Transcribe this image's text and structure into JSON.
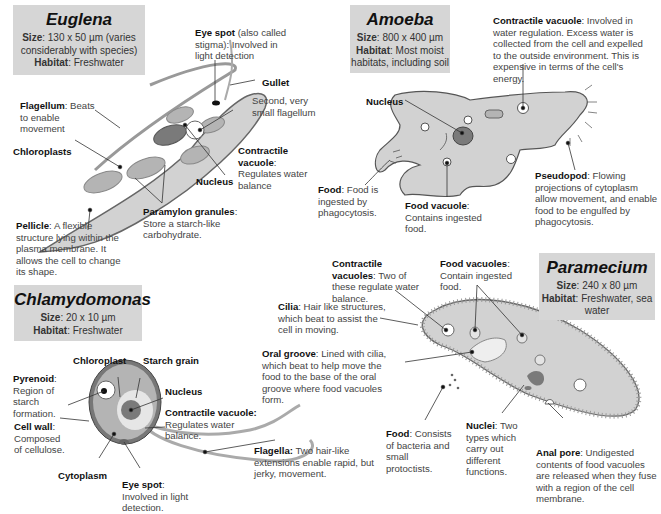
{
  "euglena": {
    "title": "Euglena",
    "size_label": "Size",
    "size_value": ": 130 x 50 µm (varies considerably with species)",
    "habitat_label": "Habitat",
    "habitat_value": ": Freshwater",
    "labels": {
      "eye_spot": {
        "bold": "Eye spot",
        "text": " (also called stigma): Involved in light detection"
      },
      "gullet": {
        "bold": "Gullet",
        "text": ""
      },
      "second_flagellum": {
        "bold": "",
        "text": "Second, very small flagellum"
      },
      "flagellum": {
        "bold": "Flagellum",
        "text": ": Beats to enable  movement"
      },
      "chloroplasts": {
        "bold": "Chloroplasts",
        "text": ""
      },
      "contractile_vacuole": {
        "bold": "Contractile vacuole",
        "text": ": Regulates water balance"
      },
      "nucleus": {
        "bold": "Nucleus",
        "text": ""
      },
      "paramylon": {
        "bold": "Paramylon granules",
        "text": ": Store a starch-like carbohydrate."
      },
      "pellicle": {
        "bold": "Pellicle",
        "text": ": A flexible structure lying within the plasma membrane. It allows the cell to change its shape."
      }
    }
  },
  "amoeba": {
    "title": "Amoeba",
    "size_label": "Size",
    "size_value": ": 800 x 400 µm",
    "habitat_label": "Habitat",
    "habitat_value": ": Most moist habitats, including soil",
    "labels": {
      "contractile_vacuole": {
        "bold": "Contractile vacuole",
        "text": ": Involved in water regulation. Excess water is collected from the cell and expelled to the outside environment. This is expensive in terms of the cell's energy."
      },
      "nucleus": {
        "bold": "Nucleus",
        "text": ""
      },
      "pseudopod": {
        "bold": "Pseudopod",
        "text": ": Flowing projections of cytoplasm allow movement, and enable food to be engulfed by phagocytosis."
      },
      "food": {
        "bold": "Food",
        "text": ": Food is ingested by phagocytosis."
      },
      "food_vacuole": {
        "bold": "Food vacuole",
        "text": ": Contains ingested food."
      }
    }
  },
  "chlamydomonas": {
    "title": "Chlamydomonas",
    "size_label": "Size",
    "size_value": ": 20 x 10 µm",
    "habitat_label": "Habitat",
    "habitat_value": ": Freshwater",
    "labels": {
      "chloroplast": {
        "bold": "Chloroplast",
        "text": ""
      },
      "starch_grain": {
        "bold": "Starch grain",
        "text": ""
      },
      "pyrenoid": {
        "bold": "Pyrenoid",
        "text": ": Region of starch formation."
      },
      "nucleus": {
        "bold": "Nucleus",
        "text": ""
      },
      "contractile_vacuole": {
        "bold": "Contractile vacuole:",
        "text": " Regulates water balance."
      },
      "cell_wall": {
        "bold": "Cell wall",
        "text": ": Composed of cellulose."
      },
      "flagella": {
        "bold": "Flagella:",
        "text": " Two hair-like extensions enable rapid, but jerky, movement."
      },
      "cytoplasm": {
        "bold": "Cytoplasm",
        "text": ""
      },
      "eye_spot": {
        "bold": "Eye spot",
        "text": ": Involved in light detection."
      }
    }
  },
  "paramecium": {
    "title": "Paramecium",
    "size_label": "Size",
    "size_value": ": 240 x 80 µm",
    "habitat_label": "Habitat",
    "habitat_value": ": Freshwater, sea water",
    "labels": {
      "contractile_vacuoles": {
        "bold": "Contractile vacuoles",
        "text": ": Two of these regulate water balance."
      },
      "food_vacuoles": {
        "bold": "Food vacuoles",
        "text": ": Contain ingested food."
      },
      "cilia": {
        "bold": "Cilia",
        "text": ": Hair like structures, which beat to assist the cell in moving."
      },
      "oral_groove": {
        "bold": "Oral groove",
        "text": ": Lined with cilia, which beat to help move the food to the base of the oral groove where food vacuoles form."
      },
      "food": {
        "bold": "Food",
        "text": ": Consists of bacteria and small protoctists."
      },
      "nuclei": {
        "bold": "Nuclei",
        "text": ": Two types which carry out different functions."
      },
      "anal_pore": {
        "bold": "Anal pore",
        "text": ": Undigested contents of food vacuoles are released when they fuse with a region of the cell membrane."
      }
    }
  },
  "colors": {
    "title_box": "#d6d6d6",
    "cell_fill": "#d2d2d2",
    "organelle": "#b4b4b4",
    "nucleus": "#7a7a7a"
  }
}
